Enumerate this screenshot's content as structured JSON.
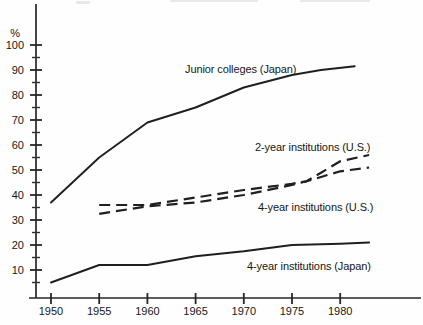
{
  "page": {
    "background_color": "#fefefe",
    "ink_color": "#1f1f1f"
  },
  "chart_data": {
    "type": "line",
    "title": "",
    "subtitle": "",
    "xlabel": "",
    "ylabel": "%",
    "grid": false,
    "legend_position": "inline-labels-on-plot",
    "xlim": [
      1948,
      1988
    ],
    "ylim": [
      0,
      105
    ],
    "x_ticks": [
      "1950",
      "1955",
      "1960",
      "1965",
      "1970",
      "1975",
      "1980"
    ],
    "y_ticks": [
      100,
      90,
      80,
      70,
      60,
      50,
      40,
      30,
      20,
      10
    ],
    "y_minor_ticks": [
      95,
      85,
      75,
      65,
      55,
      45,
      35,
      25,
      15,
      5
    ],
    "series": [
      {
        "name": "Junior colleges (Japan)",
        "style": "solid",
        "points": [
          [
            1950,
            37
          ],
          [
            1955,
            55
          ],
          [
            1960,
            69
          ],
          [
            1965,
            75
          ],
          [
            1970,
            83
          ],
          [
            1975,
            88
          ],
          [
            1978,
            90
          ],
          [
            1981.5,
            91.5
          ]
        ]
      },
      {
        "name": "2-year institutions (U.S.)",
        "style": "dashed",
        "points": [
          [
            1955,
            36
          ],
          [
            1960,
            36
          ],
          [
            1965,
            39
          ],
          [
            1970,
            42
          ],
          [
            1975,
            44.5
          ],
          [
            1976.5,
            45.5
          ],
          [
            1980,
            53.5
          ],
          [
            1983,
            56
          ]
        ]
      },
      {
        "name": "4-year institutions (U.S.)",
        "style": "dashed",
        "points": [
          [
            1955,
            32.5
          ],
          [
            1960,
            35.5
          ],
          [
            1965,
            37
          ],
          [
            1970,
            40
          ],
          [
            1975,
            44
          ],
          [
            1976.5,
            45.5
          ],
          [
            1980,
            49.5
          ],
          [
            1983,
            51
          ]
        ]
      },
      {
        "name": "4-year institutions (Japan)",
        "style": "solid",
        "points": [
          [
            1950,
            5
          ],
          [
            1955,
            12
          ],
          [
            1960,
            12
          ],
          [
            1965,
            15.5
          ],
          [
            1970,
            17.5
          ],
          [
            1975,
            20
          ],
          [
            1980,
            20.5
          ],
          [
            1983,
            21
          ]
        ]
      }
    ],
    "annotations": [
      {
        "text": "Junior colleges (Japan)",
        "x": 185,
        "y": 73
      },
      {
        "text": "2-year institutions (U.S.)",
        "x": 255,
        "y": 151
      },
      {
        "text": "4-year institutions (U.S.)",
        "x": 258,
        "y": 211
      },
      {
        "text": "4-year institutions (Japan)",
        "x": 247,
        "y": 270
      }
    ]
  }
}
